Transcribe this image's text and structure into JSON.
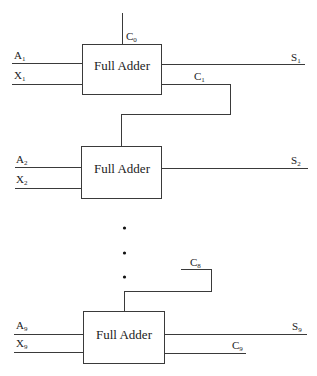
{
  "diagram": {
    "type": "ripple-carry-adder",
    "colors": {
      "line": "#3a3a3a",
      "text": "#222222",
      "background": "#ffffff"
    },
    "stages": [
      {
        "label": "Full Adder",
        "inputs": [
          {
            "name": "A",
            "sub": "1"
          },
          {
            "name": "X",
            "sub": "1"
          }
        ],
        "carry_in": {
          "name": "C",
          "sub": "0"
        },
        "sum_out": {
          "name": "S",
          "sub": "1"
        },
        "carry_out": {
          "name": "C",
          "sub": "1"
        }
      },
      {
        "label": "Full Adder",
        "inputs": [
          {
            "name": "A",
            "sub": "2"
          },
          {
            "name": "X",
            "sub": "2"
          }
        ],
        "sum_out": {
          "name": "S",
          "sub": "2"
        }
      },
      {
        "label": "Full Adder",
        "inputs": [
          {
            "name": "A",
            "sub": "9"
          },
          {
            "name": "X",
            "sub": "9"
          }
        ],
        "carry_in": {
          "name": "C",
          "sub": "8"
        },
        "sum_out": {
          "name": "S",
          "sub": "9"
        },
        "carry_out": {
          "name": "C",
          "sub": "9"
        }
      }
    ],
    "ellipsis": "⋮"
  }
}
